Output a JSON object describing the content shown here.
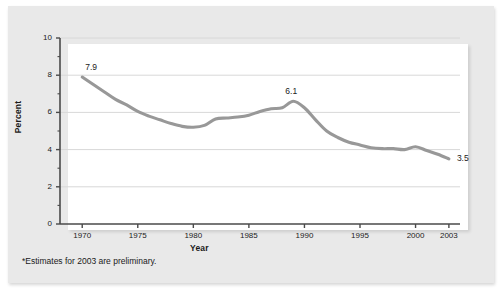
{
  "figure": {
    "footnote": "*Estimates for 2003 are preliminary.",
    "colors": {
      "line": "#989898",
      "grid": "#d8d8d8",
      "axis": "#4a4a4a",
      "panel": "#ffffff",
      "backdrop": "#e9e9e9",
      "text": "#222222"
    }
  },
  "chart_data": {
    "type": "line",
    "title": "",
    "xlabel": "Year",
    "ylabel": "Percent",
    "xlim": [
      1968,
      2004
    ],
    "ylim": [
      0,
      10
    ],
    "grid": true,
    "legend": "none",
    "y_ticks_major": [
      "0",
      "2",
      "4",
      "6",
      "8",
      "10"
    ],
    "y_ticks_major_values": [
      0,
      2,
      4,
      6,
      8,
      10
    ],
    "y_ticks_minor_values": [
      1,
      3,
      5,
      7,
      9
    ],
    "x_ticks": [
      "1970",
      "1975",
      "1980",
      "1985",
      "1990",
      "1995",
      "2000",
      "2003"
    ],
    "x_ticks_values": [
      1970,
      1975,
      1980,
      1985,
      1990,
      1995,
      2000,
      2003
    ],
    "series": [
      {
        "name": "Percent",
        "x": [
          1970,
          1971,
          1972,
          1973,
          1974,
          1975,
          1976,
          1977,
          1978,
          1979,
          1980,
          1981,
          1982,
          1983,
          1984,
          1985,
          1986,
          1987,
          1988,
          1989,
          1990,
          1991,
          1992,
          1993,
          1994,
          1995,
          1996,
          1997,
          1998,
          1999,
          2000,
          2001,
          2002,
          2003
        ],
        "values": [
          7.9,
          7.5,
          7.1,
          6.7,
          6.4,
          6.05,
          5.8,
          5.6,
          5.4,
          5.25,
          5.2,
          5.3,
          5.65,
          5.7,
          5.75,
          5.85,
          6.05,
          6.2,
          6.25,
          6.6,
          6.25,
          5.6,
          5.0,
          4.65,
          4.4,
          4.25,
          4.1,
          4.05,
          4.05,
          4.0,
          4.15,
          3.95,
          3.75,
          3.5
        ]
      }
    ],
    "annotations": [
      {
        "label": "7.9",
        "x": 1970,
        "y": 7.9,
        "position": "above-right"
      },
      {
        "label": "6.1",
        "x": 1989,
        "y": 6.6,
        "position": "above"
      },
      {
        "label": "3.5",
        "x": 2003,
        "y": 3.5,
        "position": "right"
      }
    ]
  }
}
